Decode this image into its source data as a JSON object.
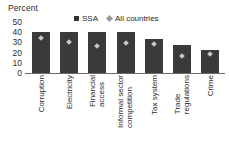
{
  "chart_data": {
    "type": "bar",
    "title": "",
    "subtitle": "",
    "xlabel": "",
    "ylabel": "Percent",
    "ylim": [
      0,
      50
    ],
    "yticks": [
      50,
      40,
      30,
      20,
      10,
      0
    ],
    "grid": false,
    "legend_position": "top-center",
    "categories": [
      "Corruption",
      "Electricity",
      "Financial access",
      "Informal sector competition",
      "Tax system",
      "Trade regulations",
      "Crime"
    ],
    "category_lines": [
      [
        "Corruption"
      ],
      [
        "Electricity"
      ],
      [
        "Financial",
        "access"
      ],
      [
        "Informal sector",
        "competition"
      ],
      [
        "Tax system"
      ],
      [
        "Trade",
        "regulations"
      ],
      [
        "Crime"
      ]
    ],
    "series": [
      {
        "name": "SSA",
        "marker": "square",
        "render": "bar",
        "color": "#3a3a3a",
        "values": [
          40,
          40,
          40,
          40,
          33,
          27,
          23
        ]
      },
      {
        "name": "All countries",
        "marker": "diamond",
        "render": "point",
        "color": "#c9c9c9",
        "values": [
          34,
          30,
          26,
          29,
          28,
          17,
          19
        ]
      }
    ]
  },
  "legend": {
    "entries": [
      {
        "label": "SSA",
        "swatch": "square-dark-icon"
      },
      {
        "label": "All countries",
        "swatch": "diamond-gray-icon"
      }
    ]
  },
  "axis": {
    "y_title": "Percent",
    "tick_50": "50",
    "tick_40": "40",
    "tick_30": "30",
    "tick_20": "20",
    "tick_10": "10",
    "tick_0": "0"
  }
}
